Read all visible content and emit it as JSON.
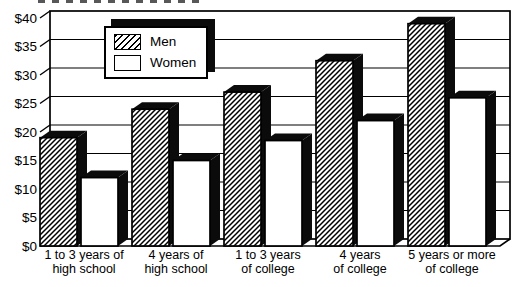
{
  "chart_data": {
    "type": "bar",
    "style": "3d-grouped-pseudo-perspective",
    "title": "",
    "xlabel": "",
    "ylabel": "",
    "ylim": [
      0,
      40
    ],
    "grid": "horizontal",
    "y_ticks": [
      "$0",
      "$5",
      "$10",
      "$15",
      "$20",
      "$25",
      "$30",
      "$35",
      "$40"
    ],
    "y_tick_values": [
      0,
      5,
      10,
      15,
      20,
      25,
      30,
      35,
      40
    ],
    "categories": [
      [
        "1 to 3 years of",
        "high school"
      ],
      [
        "4 years of",
        "high school"
      ],
      [
        "1 to 3 years",
        "of college"
      ],
      [
        "4 years",
        "of college"
      ],
      [
        "5 years or more",
        "of college"
      ]
    ],
    "series": [
      {
        "name": "Men",
        "pattern": "diagonal-hatch",
        "values": [
          19,
          24,
          27,
          32.5,
          39
        ]
      },
      {
        "name": "Women",
        "pattern": "solid-white",
        "values": [
          12,
          15,
          18.5,
          22,
          26
        ]
      }
    ],
    "legend": {
      "position": "top-left-inside",
      "entries": [
        "Men",
        "Women"
      ]
    },
    "colors": {
      "ink": "#000000",
      "paper": "#ffffff",
      "bar_top_side": "#0b0b0b"
    }
  }
}
